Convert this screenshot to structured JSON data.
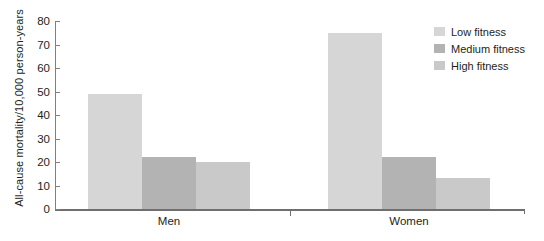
{
  "chart_data": {
    "type": "bar",
    "title": "",
    "xlabel": "",
    "ylabel": "All-cause mortality/10,000 person-years",
    "categories": [
      "Men",
      "Women"
    ],
    "series": [
      {
        "name": "Low fitness",
        "values": [
          49,
          75
        ],
        "color": "#d6d6d6"
      },
      {
        "name": "Medium fitness",
        "values": [
          22,
          22
        ],
        "color": "#b3b3b3"
      },
      {
        "name": "High fitness",
        "values": [
          20,
          13
        ],
        "color": "#c9c9c9"
      }
    ],
    "ylim": [
      0,
      80
    ],
    "yticks": [
      0,
      10,
      20,
      30,
      40,
      50,
      60,
      70,
      80
    ],
    "ytick_labels": [
      "0",
      "10",
      "20",
      "30",
      "40",
      "50",
      "60",
      "70",
      "80"
    ],
    "grid": false,
    "legend_position": "top-right"
  },
  "axis": {
    "y_title": "All-cause mortality/10,000 person-years"
  },
  "legend": {
    "items": [
      {
        "label": "Low fitness",
        "color": "#d6d6d6"
      },
      {
        "label": "Medium fitness",
        "color": "#b3b3b3"
      },
      {
        "label": "High fitness",
        "color": "#c9c9c9"
      }
    ]
  },
  "x_axis_labels": [
    "Men",
    "Women"
  ]
}
